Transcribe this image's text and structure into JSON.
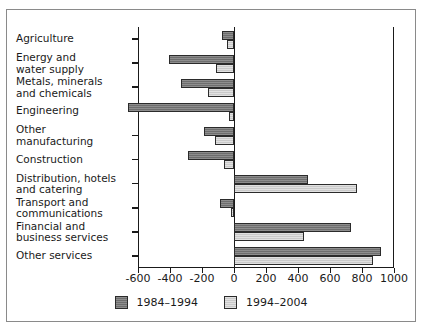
{
  "chart_data": {
    "type": "bar",
    "orientation": "horizontal",
    "title": "",
    "xlabel": "",
    "ylabel": "",
    "xlim": [
      -600,
      1000
    ],
    "xticks": [
      -600,
      -400,
      -200,
      0,
      200,
      400,
      600,
      800,
      1000
    ],
    "xticklabels": [
      "-600",
      "-400",
      "-200",
      "0",
      "200",
      "400",
      "600",
      "800",
      "1000"
    ],
    "grid": false,
    "legend_position": "bottom-center",
    "categories": [
      "Agriculture",
      "Energy and\nwater supply",
      "Metals, minerals\nand chemicals",
      "Engineering",
      "Other\nmanufacturing",
      "Construction",
      "Distribution, hotels\nand catering",
      "Transport and\ncommunications",
      "Financial and\nbusiness services",
      "Other services"
    ],
    "series": [
      {
        "name": "1984–1994",
        "color": "#6e6e6e",
        "values": [
          -75,
          -405,
          -330,
          -660,
          -190,
          -290,
          460,
          -90,
          730,
          920
        ]
      },
      {
        "name": "1994–2004",
        "color": "#c9c9c9",
        "values": [
          -45,
          -115,
          -165,
          -30,
          -120,
          -65,
          770,
          -20,
          440,
          870
        ]
      }
    ]
  },
  "legend": {
    "items": [
      {
        "label": "1984–1994",
        "swatch": "series-0-swatch"
      },
      {
        "label": "1994–2004",
        "swatch": "series-1-swatch"
      }
    ]
  },
  "axis": {
    "tick_labels": [
      "-600",
      "-400",
      "-200",
      "0",
      "200",
      "400",
      "600",
      "800",
      "1000"
    ]
  },
  "category_labels": [
    "Agriculture",
    "Energy and water supply",
    "Metals, minerals and chemicals",
    "Engineering",
    "Other manufacturing",
    "Construction",
    "Distribution, hotels and catering",
    "Transport and communications",
    "Financial and business services",
    "Other services"
  ]
}
